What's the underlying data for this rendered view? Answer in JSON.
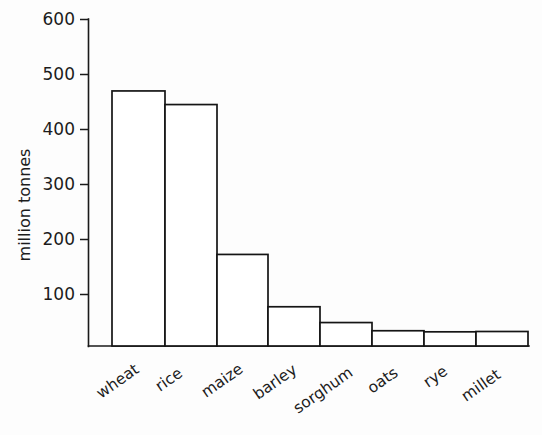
{
  "chart_data": {
    "type": "bar",
    "title": "",
    "subtitle": "",
    "xlabel": "",
    "ylabel": "million tonnes",
    "categories": [
      "wheat",
      "rice",
      "maize",
      "barley",
      "sorghum",
      "oats",
      "rye",
      "millet"
    ],
    "values": [
      522,
      468,
      443,
      168,
      72,
      43,
      28,
      26
    ],
    "ylim": [
      0,
      600
    ],
    "yticks": [
      100,
      200,
      300,
      400,
      500,
      600
    ],
    "ytick_labels": [
      "100",
      "200",
      "300",
      "400",
      "500",
      "600"
    ],
    "grid": false,
    "legend": null,
    "bar_fill_color": "#ffffff",
    "bar_edge_color": "#151515",
    "axis_color": "#1a1a1a",
    "background_color": "#fdfdfd",
    "x_tick_label_rotation": -35,
    "annotations": []
  },
  "figure": {
    "width": 542,
    "height": 435
  }
}
